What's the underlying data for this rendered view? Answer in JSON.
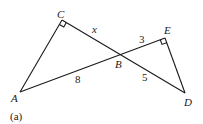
{
  "figure": {
    "caption": "(a)",
    "points": {
      "A": {
        "label": "A"
      },
      "B": {
        "label": "B"
      },
      "C": {
        "label": "C"
      },
      "D": {
        "label": "D"
      },
      "E": {
        "label": "E"
      }
    },
    "segments": {
      "CB": {
        "label": "x"
      },
      "BE": {
        "label": "3"
      },
      "AB": {
        "label": "8"
      },
      "BD": {
        "label": "5"
      }
    },
    "right_angles": [
      "C",
      "E"
    ]
  }
}
